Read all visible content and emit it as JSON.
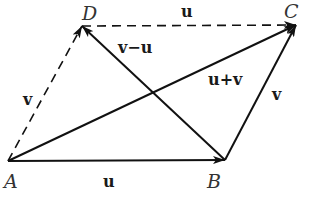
{
  "diagram": {
    "type": "vector-parallelogram",
    "points": {
      "A": {
        "label": "A",
        "x": 8,
        "y": 161
      },
      "B": {
        "label": "B",
        "x": 225,
        "y": 160
      },
      "C": {
        "label": "C",
        "x": 296,
        "y": 25
      },
      "D": {
        "label": "D",
        "x": 82,
        "y": 26
      }
    },
    "vectors": [
      {
        "id": "AB",
        "from": "A",
        "to": "B",
        "label": "u",
        "style": "solid"
      },
      {
        "id": "BC",
        "from": "B",
        "to": "C",
        "label": "v",
        "style": "solid"
      },
      {
        "id": "AC",
        "from": "A",
        "to": "C",
        "label": "u+v",
        "style": "solid"
      },
      {
        "id": "BD",
        "from": "B",
        "to": "D",
        "label": "v−u",
        "style": "solid"
      },
      {
        "id": "AD",
        "from": "A",
        "to": "D",
        "label": "v",
        "style": "dashed"
      },
      {
        "id": "DC",
        "from": "D",
        "to": "C",
        "label": "u",
        "style": "dashed"
      }
    ],
    "colors": {
      "stroke": "#111111",
      "label": "#1a1a1a",
      "point_label": "#333333"
    }
  }
}
